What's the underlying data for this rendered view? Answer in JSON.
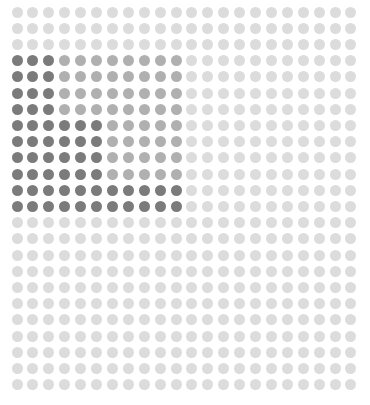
{
  "chart_data": {
    "type": "heatmap",
    "subtype": "dot-grid-waffle",
    "title": "",
    "xlabel": "",
    "ylabel": "",
    "grid": {
      "columns": 22,
      "rows": 24
    },
    "levels": {
      "light": "#dcdcdc",
      "medium": "#b0b0b0",
      "dark": "#7b7b7b"
    },
    "regions": [
      {
        "rows": [
          0,
          2
        ],
        "segments": [
          {
            "cols": [
              0,
              21
            ],
            "level": "light"
          }
        ]
      },
      {
        "rows": [
          3,
          6
        ],
        "segments": [
          {
            "cols": [
              0,
              2
            ],
            "level": "dark"
          },
          {
            "cols": [
              3,
              10
            ],
            "level": "medium"
          },
          {
            "cols": [
              11,
              21
            ],
            "level": "light"
          }
        ]
      },
      {
        "rows": [
          7,
          10
        ],
        "segments": [
          {
            "cols": [
              0,
              5
            ],
            "level": "dark"
          },
          {
            "cols": [
              6,
              10
            ],
            "level": "medium"
          },
          {
            "cols": [
              11,
              21
            ],
            "level": "light"
          }
        ]
      },
      {
        "rows": [
          11,
          12
        ],
        "segments": [
          {
            "cols": [
              0,
              10
            ],
            "level": "dark"
          },
          {
            "cols": [
              11,
              21
            ],
            "level": "light"
          }
        ]
      },
      {
        "rows": [
          13,
          23
        ],
        "segments": [
          {
            "cols": [
              0,
              21
            ],
            "level": "light"
          }
        ]
      }
    ],
    "counts": {
      "total": 528,
      "dark": 56,
      "medium": 52,
      "light": 420
    }
  },
  "layout": {
    "origin_x": 11.5,
    "origin_y": 6.5,
    "step_x": 15.9,
    "step_y": 16.2,
    "dot_size": 11
  }
}
